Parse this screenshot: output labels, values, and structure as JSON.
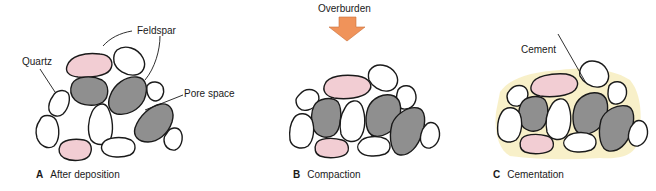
{
  "figure": {
    "colors": {
      "quartz": "#ffffff",
      "feldspar": "#f2cdd3",
      "dark_grain": "#8f8f8f",
      "cement": "#f7edc0",
      "arrow": "#f0935a",
      "outline": "#1a1a1a"
    },
    "panels": [
      {
        "letter": "A",
        "caption": "After deposition",
        "labels": [
          "Quartz",
          "Feldspar",
          "Pore space"
        ]
      },
      {
        "letter": "B",
        "caption": "Compaction",
        "labels": [
          "Overburden"
        ]
      },
      {
        "letter": "C",
        "caption": "Cementation",
        "labels": [
          "Cement"
        ]
      }
    ]
  }
}
